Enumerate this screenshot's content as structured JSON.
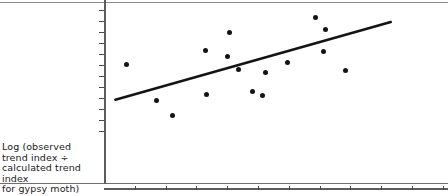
{
  "chart_data": {
    "type": "scatter",
    "title": "",
    "subtitle": "",
    "xlabel": "",
    "ylabel": "Log (observed trend index ÷ calculated trend index for gypsy moth)",
    "ylabel_lines": [
      "Log (observed",
      "trend index ÷",
      "calculated trend index",
      "for gypsy moth)"
    ],
    "ylim": [
      -3.25,
      2.7
    ],
    "yticks": [
      2.5,
      2.0,
      1.5,
      1.0,
      0.5,
      0,
      -0.5,
      -1.0,
      -1.5,
      -2.0,
      -2.5,
      -3.0
    ],
    "ytick_labels": [
      "2.5",
      "2.0",
      "1.5",
      "1.0",
      "0.5",
      "0",
      "−0.5",
      "−1.0",
      "−1.5",
      "−2.0",
      "−2.5",
      "−3.0"
    ],
    "xlim": [
      0,
      12.5
    ],
    "xticks": [
      1,
      2,
      3,
      4,
      5,
      6,
      7,
      8,
      9,
      10,
      11
    ],
    "xtick_labels": [
      "",
      "",
      "",
      "",
      "",
      "",
      "",
      "",
      "",
      "",
      ""
    ],
    "xtick_note": "x-axis tick labels are clipped at the bottom edge of the screenshot",
    "grid": false,
    "legend": null,
    "points": [
      {
        "x": 0.72,
        "y": 0.02
      },
      {
        "x": 1.72,
        "y": -1.6
      },
      {
        "x": 2.21,
        "y": -2.3
      },
      {
        "x": 3.28,
        "y": 0.68
      },
      {
        "x": 3.33,
        "y": -1.35
      },
      {
        "x": 4.06,
        "y": 1.48
      },
      {
        "x": 4.02,
        "y": 0.37
      },
      {
        "x": 4.37,
        "y": -0.2
      },
      {
        "x": 4.82,
        "y": -1.2
      },
      {
        "x": 5.14,
        "y": -1.4
      },
      {
        "x": 5.25,
        "y": -0.33
      },
      {
        "x": 5.96,
        "y": 0.1
      },
      {
        "x": 6.86,
        "y": 2.17
      },
      {
        "x": 7.18,
        "y": 1.62
      },
      {
        "x": 7.14,
        "y": 0.6
      },
      {
        "x": 7.85,
        "y": -0.27
      }
    ],
    "trend_line": {
      "type": "linear",
      "x_start": 0.37,
      "y_start": -1.58,
      "x_end": 9.31,
      "y_end": 1.95
    }
  }
}
